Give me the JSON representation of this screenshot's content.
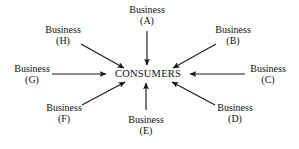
{
  "figure": {
    "hub_label": "CONSUMERS",
    "background_color": "#ffffff",
    "ink_color": "#1a1a1a"
  },
  "nodes": [
    {
      "name": "Business",
      "tag": "(A)",
      "position": "top"
    },
    {
      "name": "Business",
      "tag": "(B)",
      "position": "upper-right"
    },
    {
      "name": "Business",
      "tag": "(C)",
      "position": "right"
    },
    {
      "name": "Business",
      "tag": "(D)",
      "position": "lower-right"
    },
    {
      "name": "Business",
      "tag": "(E)",
      "position": "bottom"
    },
    {
      "name": "Business",
      "tag": "(F)",
      "position": "lower-left"
    },
    {
      "name": "Business",
      "tag": "(G)",
      "position": "left"
    },
    {
      "name": "Business",
      "tag": "(H)",
      "position": "upper-left"
    }
  ]
}
